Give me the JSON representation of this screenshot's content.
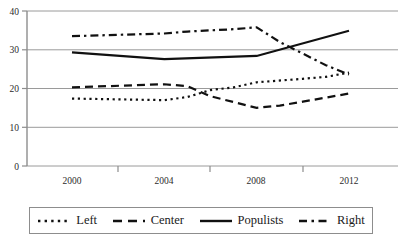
{
  "chart_data": {
    "type": "line",
    "title": "",
    "subtitle": "",
    "xlabel": "",
    "ylabel": "",
    "x": [
      2000,
      2001,
      2002,
      2003,
      2004,
      2005,
      2006,
      2007,
      2008,
      2009,
      2010,
      2011,
      2012
    ],
    "categories": [
      "2000",
      "2004",
      "2008",
      "2012"
    ],
    "xtick_labels": [
      "2000",
      "2004",
      "2008",
      "2012"
    ],
    "ytick_labels": [
      "0",
      "10",
      "20",
      "30",
      "40"
    ],
    "ytick_values": [
      0,
      10,
      20,
      30,
      40
    ],
    "xlim": [
      2000,
      2012
    ],
    "ylim": [
      0,
      40
    ],
    "grid": "horizontal",
    "legend_position": "below",
    "series": [
      {
        "name": "Left",
        "style": "dotted",
        "color": "#111111",
        "x": [
          2000,
          2004,
          2005,
          2006,
          2007,
          2008,
          2010,
          2011,
          2012
        ],
        "values": [
          17.4,
          17.0,
          17.8,
          19.6,
          20.3,
          21.6,
          22.5,
          23.0,
          24.1
        ]
      },
      {
        "name": "Center",
        "style": "dashed",
        "color": "#111111",
        "x": [
          2000,
          2004,
          2005,
          2006,
          2008,
          2009,
          2010,
          2012
        ],
        "values": [
          20.3,
          21.1,
          20.6,
          18.0,
          15.0,
          15.6,
          16.6,
          18.7
        ]
      },
      {
        "name": "Populists",
        "style": "solid",
        "color": "#111111",
        "x": [
          2000,
          2004,
          2008,
          2012
        ],
        "values": [
          29.3,
          27.6,
          28.4,
          34.9
        ]
      },
      {
        "name": "Right",
        "style": "dashdot",
        "color": "#111111",
        "x": [
          2000,
          2004,
          2005,
          2007,
          2008,
          2009,
          2011,
          2012
        ],
        "values": [
          33.5,
          34.2,
          34.7,
          35.3,
          35.8,
          32.0,
          26.0,
          23.6
        ]
      }
    ]
  },
  "legend": {
    "items": [
      {
        "label": "Left",
        "style": "dotted"
      },
      {
        "label": "Center",
        "style": "dashed"
      },
      {
        "label": "Populists",
        "style": "solid"
      },
      {
        "label": "Right",
        "style": "dashdot"
      }
    ]
  },
  "axis": {
    "y_ticks": [
      "40",
      "30",
      "20",
      "10",
      "0"
    ],
    "x_ticks": [
      "2000",
      "2004",
      "2008",
      "2012"
    ]
  },
  "colors": {
    "line": "#111111",
    "grid": "#9a9a9a",
    "axis": "#8d8d8d",
    "text": "#1a1a1a",
    "background": "#ffffff"
  }
}
